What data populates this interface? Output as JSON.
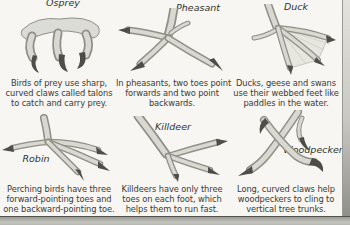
{
  "page": {
    "background": "#f7f6f2",
    "edge_line_color": "#9a9a95",
    "bottom_bar_color": "#b0b0ab",
    "text_color": "#3a3a36"
  },
  "panels": [
    {
      "id": "osprey",
      "label": "Osprey",
      "illustration": "osprey-talons-drawing",
      "caption_lines": [
        "Birds of prey use sharp,",
        "curved claws called talons",
        "to catch and carry prey."
      ]
    },
    {
      "id": "pheasant",
      "label": "Pheasant",
      "illustration": "pheasant-foot-drawing",
      "caption_lines": [
        "In pheasants, two toes point",
        "forwards and two point",
        "backwards."
      ]
    },
    {
      "id": "duck",
      "label": "Duck",
      "illustration": "duck-webbed-foot-drawing",
      "caption_lines": [
        "Ducks, geese and swans",
        "use their webbed feet like",
        "paddles in the water."
      ]
    },
    {
      "id": "robin",
      "label": "Robin",
      "illustration": "robin-foot-drawing",
      "caption_lines": [
        "Perching birds have three",
        "forward-pointing toes and",
        "one backward-pointing toe."
      ]
    },
    {
      "id": "killdeer",
      "label": "Killdeer",
      "illustration": "killdeer-foot-drawing",
      "caption_lines": [
        "Killdeers have only three",
        "toes on each foot, which",
        "helps them to run fast."
      ]
    },
    {
      "id": "woodpecker",
      "label": "Woodpecker",
      "illustration": "woodpecker-claws-drawing",
      "caption_lines": [
        "Long, curved claws help",
        "woodpeckers to cling to",
        "vertical tree trunks."
      ]
    }
  ]
}
